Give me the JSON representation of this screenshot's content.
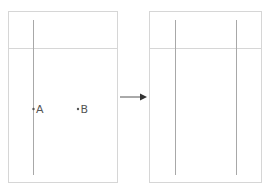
{
  "diagram": {
    "colors": {
      "frame": "#d6d6d6",
      "guide": "#a8a8a8",
      "arrow": "#333333",
      "text": "#555555"
    },
    "left_panel": {
      "points": [
        {
          "id": "A",
          "label": "A"
        },
        {
          "id": "B",
          "label": "B"
        }
      ],
      "vertical_guides": 1
    },
    "arrow": {
      "direction": "right"
    },
    "right_panel": {
      "vertical_guides": 2
    }
  }
}
